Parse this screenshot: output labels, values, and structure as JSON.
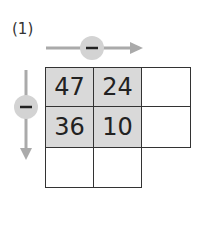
{
  "label": "(1)",
  "operation": {
    "symbol": "−",
    "name": "subtraction"
  },
  "grid": {
    "cells": [
      [
        "47",
        "24",
        ""
      ],
      [
        "36",
        "10",
        ""
      ],
      [
        "",
        ""
      ]
    ]
  },
  "colors": {
    "arrow": "#aaaaaa",
    "circle": "#d3d3d3",
    "shaded": "#d9d9d9",
    "border": "#333333"
  }
}
